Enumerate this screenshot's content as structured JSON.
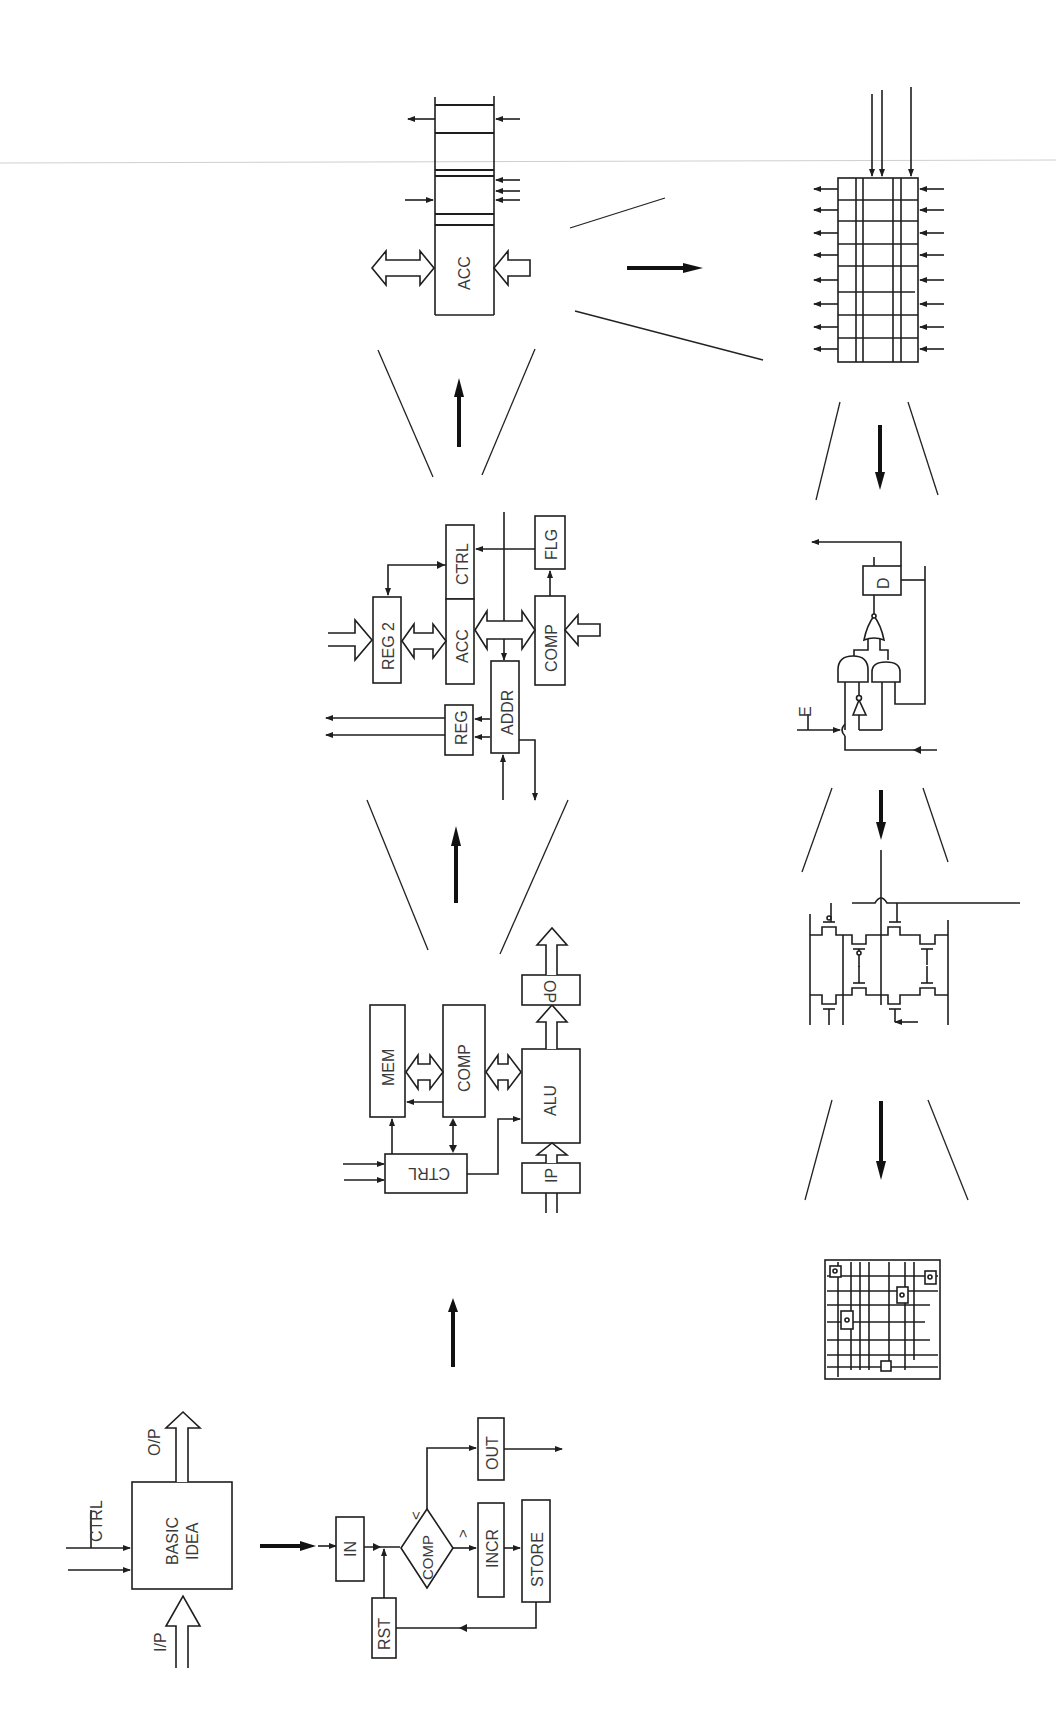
{
  "figure": {
    "orientation": "rotated 90 degrees counter-clockwise"
  },
  "stages": {
    "basic_idea": {
      "box_label_line1": "BASIC",
      "box_label_line2": "IDEA",
      "input_control": "CTRL",
      "input_data": "I/P",
      "output": "O/P"
    },
    "flowchart": {
      "in": "IN",
      "reset": "RST",
      "compare": "COMP",
      "less_than": "<",
      "greater_than": ">",
      "increment": "INCR",
      "store": "STORE",
      "output": "OUT"
    },
    "block_diagram": {
      "control": "CTRL",
      "memory": "MEM",
      "comparator": "COMP",
      "alu": "ALU",
      "input_port": "IP",
      "output_port": "OP"
    },
    "register_transfer": {
      "register2": "REG 2",
      "accumulator": "ACC",
      "control": "CTRL",
      "flags": "FLG",
      "comparator": "COMP",
      "address": "ADDR",
      "register": "REG"
    },
    "register_detail": {
      "accumulator": "ACC"
    },
    "bit_slice": {
      "rows": 8
    },
    "gate_level": {
      "enable": "E",
      "flipflop": "D"
    },
    "transistor_level": {},
    "layout": {}
  },
  "colors": {
    "ink": "#1e1e1e",
    "text": "#3a3a3a",
    "background": "#ffffff",
    "scan_line": "#cfcfcf"
  }
}
